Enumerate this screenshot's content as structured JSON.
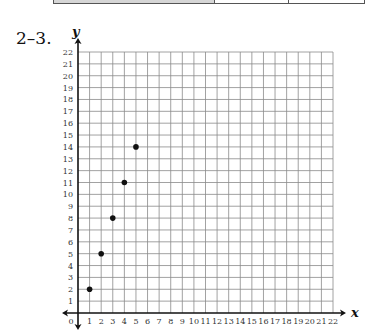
{
  "problem": {
    "label": "2–3."
  },
  "top_table": {
    "cells": [
      {
        "width": 162,
        "fill": "#d6d6d6"
      },
      {
        "width": 75,
        "fill": "#ffffff"
      },
      {
        "width": 75,
        "fill": "#ffffff"
      }
    ]
  },
  "chart_data": {
    "type": "scatter",
    "title": "",
    "xlabel": "x",
    "ylabel": "y",
    "xlim": [
      0,
      22
    ],
    "ylim": [
      0,
      22
    ],
    "grid": true,
    "x_ticks": [
      0,
      1,
      2,
      3,
      4,
      5,
      6,
      7,
      8,
      9,
      10,
      11,
      12,
      13,
      14,
      15,
      16,
      17,
      18,
      19,
      20,
      21,
      22
    ],
    "y_ticks": [
      1,
      2,
      3,
      4,
      5,
      6,
      7,
      8,
      9,
      10,
      11,
      12,
      13,
      14,
      15,
      16,
      17,
      18,
      19,
      20,
      21,
      22
    ],
    "series": [
      {
        "name": "points",
        "x": [
          1,
          2,
          3,
          4,
          5
        ],
        "y": [
          2,
          5,
          8,
          11,
          14
        ],
        "color": "#111111"
      }
    ]
  }
}
